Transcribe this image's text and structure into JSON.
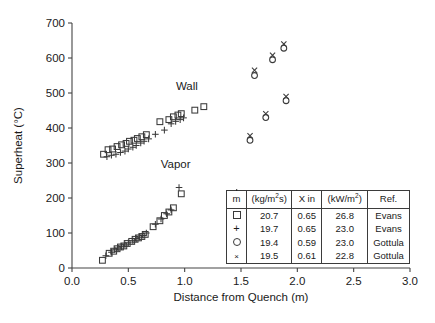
{
  "chart_data": {
    "type": "scatter",
    "title": "",
    "xlabel": "Distance from Quench (m)",
    "ylabel": "Superheat (°C)",
    "xlim": [
      0.0,
      3.0
    ],
    "ylim": [
      0,
      700
    ],
    "xticks": [
      "0.0",
      "0.5",
      "1.0",
      "1.5",
      "2.0",
      "2.5",
      "3.0"
    ],
    "yticks": [
      "0",
      "100",
      "200",
      "300",
      "400",
      "500",
      "600",
      "700"
    ],
    "grid": false,
    "legend_position": "inside-lower-right",
    "annotations": [
      {
        "text": "Wall",
        "x": 1.02,
        "y": 510
      },
      {
        "text": "Vapor",
        "x": 0.92,
        "y": 285
      }
    ],
    "series": [
      {
        "name": "Evans-square-wall",
        "marker": "square",
        "group": "Wall",
        "points": [
          [
            0.28,
            325
          ],
          [
            0.32,
            338
          ],
          [
            0.36,
            340
          ],
          [
            0.4,
            347
          ],
          [
            0.44,
            352
          ],
          [
            0.48,
            356
          ],
          [
            0.51,
            362
          ],
          [
            0.55,
            365
          ],
          [
            0.58,
            370
          ],
          [
            0.62,
            375
          ],
          [
            0.66,
            381
          ],
          [
            0.78,
            418
          ],
          [
            0.86,
            424
          ],
          [
            0.9,
            432
          ],
          [
            0.94,
            437
          ],
          [
            0.97,
            441
          ],
          [
            1.09,
            451
          ],
          [
            1.17,
            461
          ]
        ]
      },
      {
        "name": "Evans-plus-wall",
        "marker": "plus",
        "group": "Wall",
        "points": [
          [
            0.31,
            318
          ],
          [
            0.35,
            322
          ],
          [
            0.39,
            325
          ],
          [
            0.43,
            330
          ],
          [
            0.47,
            334
          ],
          [
            0.5,
            340
          ],
          [
            0.54,
            345
          ],
          [
            0.57,
            350
          ],
          [
            0.61,
            357
          ],
          [
            0.64,
            362
          ],
          [
            0.68,
            369
          ],
          [
            0.74,
            382
          ],
          [
            0.82,
            394
          ],
          [
            0.88,
            412
          ],
          [
            0.92,
            419
          ],
          [
            0.96,
            424
          ],
          [
            0.99,
            429
          ]
        ]
      },
      {
        "name": "Evans-square-vapor",
        "marker": "square",
        "group": "Vapor",
        "points": [
          [
            0.27,
            22
          ],
          [
            0.33,
            42
          ],
          [
            0.37,
            48
          ],
          [
            0.4,
            55
          ],
          [
            0.43,
            60
          ],
          [
            0.46,
            63
          ],
          [
            0.49,
            70
          ],
          [
            0.53,
            76
          ],
          [
            0.56,
            82
          ],
          [
            0.59,
            86
          ],
          [
            0.62,
            90
          ],
          [
            0.65,
            96
          ],
          [
            0.72,
            118
          ],
          [
            0.78,
            135
          ],
          [
            0.82,
            150
          ],
          [
            0.86,
            160
          ],
          [
            0.9,
            172
          ],
          [
            0.97,
            212
          ]
        ]
      },
      {
        "name": "Evans-plus-vapor",
        "marker": "plus",
        "group": "Vapor",
        "points": [
          [
            0.3,
            35
          ],
          [
            0.35,
            45
          ],
          [
            0.38,
            52
          ],
          [
            0.41,
            57
          ],
          [
            0.44,
            61
          ],
          [
            0.47,
            66
          ],
          [
            0.5,
            72
          ],
          [
            0.54,
            78
          ],
          [
            0.57,
            84
          ],
          [
            0.6,
            88
          ],
          [
            0.63,
            93
          ],
          [
            0.66,
            100
          ],
          [
            0.74,
            125
          ],
          [
            0.79,
            140
          ],
          [
            0.84,
            155
          ],
          [
            0.88,
            166
          ],
          [
            0.95,
            230
          ]
        ]
      },
      {
        "name": "Gottula-circle",
        "marker": "circle",
        "group": "Right",
        "points": [
          [
            1.5,
            175
          ],
          [
            1.58,
            365
          ],
          [
            1.62,
            550
          ],
          [
            1.72,
            430
          ],
          [
            1.78,
            595
          ],
          [
            1.88,
            628
          ],
          [
            1.9,
            478
          ]
        ]
      },
      {
        "name": "Gottula-cross",
        "marker": "cross",
        "group": "Right",
        "points": [
          [
            1.5,
            188
          ],
          [
            1.58,
            378
          ],
          [
            1.62,
            565
          ],
          [
            1.72,
            441
          ],
          [
            1.78,
            608
          ],
          [
            1.88,
            640
          ],
          [
            1.9,
            490
          ]
        ]
      }
    ]
  },
  "legend": {
    "headers": {
      "symbol": "m",
      "mdot": "(kg/m²s)",
      "x_in": "X in",
      "q": "(kW/m²)",
      "ref": "Ref."
    },
    "rows": [
      {
        "symbol": "square",
        "mdot": "20.7",
        "x_in": "0.65",
        "q": "26.8",
        "ref": "Evans"
      },
      {
        "symbol": "plus",
        "mdot": "19.7",
        "x_in": "0.65",
        "q": "23.0",
        "ref": "Evans"
      },
      {
        "symbol": "circle",
        "mdot": "19.4",
        "x_in": "0.59",
        "q": "23.0",
        "ref": "Gottula"
      },
      {
        "symbol": "cross",
        "mdot": "19.5",
        "x_in": "0.61",
        "q": "22.8",
        "ref": "Gottula"
      }
    ]
  },
  "colors": {
    "background": "#ffffff",
    "axis": "#444444",
    "marker": "#3a3a3a",
    "text": "#1a1a1a"
  }
}
